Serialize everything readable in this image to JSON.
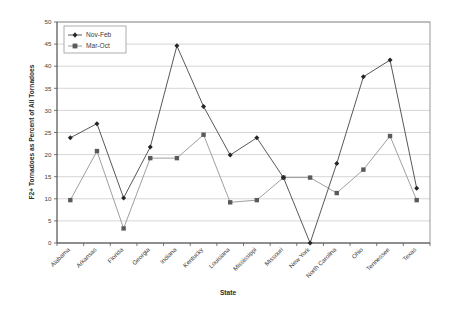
{
  "chart_data": {
    "type": "line",
    "title": "",
    "xlabel": "State",
    "ylabel": "F2+ Tornadoes as Percent of All Tornadoes",
    "ylim": [
      0,
      50
    ],
    "yticks": [
      0,
      5,
      10,
      15,
      20,
      25,
      30,
      35,
      40,
      45,
      50
    ],
    "grid": true,
    "legend_position": "top-left",
    "categories": [
      "Alabama",
      "Arkansas",
      "Florida",
      "Georgia",
      "Indiana",
      "Kentucky",
      "Louisiana",
      "Mississippi",
      "Missouri",
      "New York",
      "North Carolina",
      "Ohio",
      "Tennessee",
      "Texas"
    ],
    "series": [
      {
        "name": "Nov-Feb",
        "marker": "diamond",
        "color": "#262626",
        "values": [
          23.8,
          27.0,
          10.2,
          21.7,
          44.6,
          30.9,
          19.9,
          23.8,
          14.8,
          0.0,
          18.0,
          37.6,
          41.4,
          12.4
        ]
      },
      {
        "name": "Mar-Oct",
        "marker": "square",
        "color": "#5a5a5a",
        "values": [
          9.7,
          20.8,
          3.3,
          19.2,
          19.2,
          24.5,
          9.2,
          9.7,
          14.8,
          14.8,
          11.3,
          16.6,
          24.2,
          9.7
        ]
      }
    ]
  },
  "legend": {
    "entries": [
      {
        "label": "Nov-Feb"
      },
      {
        "label": "Mar-Oct"
      }
    ]
  },
  "axes": {
    "y_title": "F2+ Tornadoes as Percent of All Tornadoes",
    "x_title": "State"
  }
}
